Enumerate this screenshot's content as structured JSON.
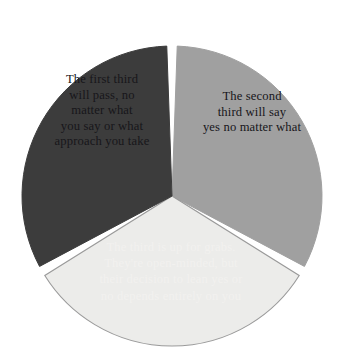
{
  "chart_data": {
    "type": "pie",
    "title": "",
    "subtitle": "",
    "xlabel": "",
    "ylabel": "",
    "legend_position": "none",
    "grid": false,
    "total_slices": 3,
    "start_angle_deg": -90,
    "gap_deg": 4,
    "center": {
      "x": 172,
      "y": 196
    },
    "radius": 150,
    "categories": [
      "The first third will pass, no matter what you say or what approach you take",
      "The second third will say yes no matter what",
      "The third is up for grabs. They're open-minded, but their decision to lean yes or no depends entirely on you"
    ],
    "values": [
      33.3,
      33.3,
      33.3
    ],
    "series": [
      {
        "name": "Thirds",
        "values": [
          33.3,
          33.3,
          33.3
        ]
      }
    ],
    "slices": [
      {
        "name": "first-third",
        "value": 33.3,
        "angle_deg": 120,
        "start_deg": -90,
        "end_deg": 30,
        "fill": "#a0a0a0",
        "stroke": "#a0a0a0",
        "text_color": "#17161a",
        "label": "The first third\nwill pass, no\nmatter what\nyou say or what\napproach you take"
      },
      {
        "name": "second-third",
        "value": 33.3,
        "angle_deg": 120,
        "start_deg": 30,
        "end_deg": 150,
        "fill": "#ececea",
        "stroke": "#9a9a9a",
        "text_color": "#17161a",
        "label": "The second\nthird will say\nyes no matter what"
      },
      {
        "name": "third-third",
        "value": 33.3,
        "angle_deg": 120,
        "start_deg": 150,
        "end_deg": 270,
        "fill": "#3c3c3c",
        "stroke": "#3c3c3c",
        "text_color": "#f2f1ef",
        "label": "The third is up for grabs.\nThey're open-minded, but\ntheir decision to lean yes or\nno depends entirely on you"
      }
    ]
  },
  "diagram": {
    "background_color": "#ffffff",
    "slice_one_label": "The first third\nwill pass, no\nmatter what\nyou say or what\napproach you take",
    "slice_two_label": "The second\nthird will say\nyes no matter what",
    "slice_three_label": "The third is up for grabs.\nThey're open-minded, but\ntheir decision to lean yes or\nno depends entirely on you"
  }
}
